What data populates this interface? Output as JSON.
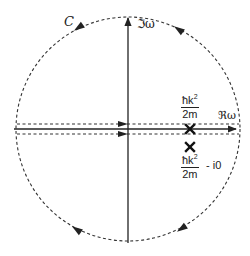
{
  "diagram": {
    "type": "complex-plane contour",
    "contour_label": "C",
    "axes": {
      "imaginary_label": "ℑω",
      "real_label": "ℜω"
    },
    "poles": [
      {
        "marker": "×",
        "position": "on real axis",
        "label_numerator_base": "ħk",
        "label_numerator_exp": "2",
        "label_denominator": "2m",
        "label_suffix": ""
      },
      {
        "marker": "×",
        "position": "below real axis",
        "label_numerator_base": "ħk",
        "label_numerator_exp": "2",
        "label_denominator": "2m",
        "label_suffix": "- i0"
      }
    ],
    "arc_arrow_direction": "counterclockwise",
    "line_color": "#222222",
    "dash_color": "#333333"
  }
}
